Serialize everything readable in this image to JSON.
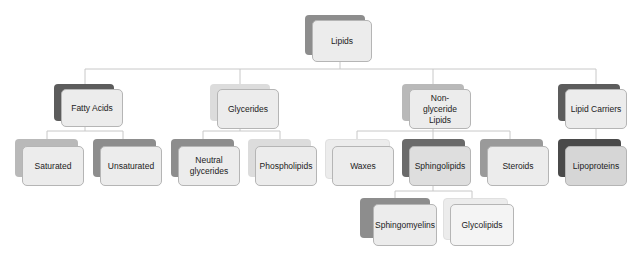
{
  "diagram": {
    "type": "hierarchy",
    "root": {
      "id": "lipids",
      "label": "Lipids",
      "shade": "#8d8d8d"
    },
    "level1": [
      {
        "id": "fatty-acids",
        "label": "Fatty Acids",
        "shade": "#5c5c5c"
      },
      {
        "id": "glycerides",
        "label": "Glycerides",
        "shade": "#dcdcdc"
      },
      {
        "id": "non-glyceride-lipids",
        "label": "Non-glyceride Lipids",
        "shade": "#a0a0a0"
      },
      {
        "id": "lipid-carriers",
        "label": "Lipid Carriers",
        "shade": "#5c5c5c"
      }
    ],
    "level2": [
      {
        "id": "saturated",
        "label": "Saturated",
        "parent": "fatty-acids",
        "shade": "#a6a6a6"
      },
      {
        "id": "unsaturated",
        "label": "Unsaturated",
        "parent": "fatty-acids",
        "shade": "#777777"
      },
      {
        "id": "neutral-glycerides",
        "label": "Neutral glycerides",
        "parent": "glycerides",
        "shade": "#8d8d8d"
      },
      {
        "id": "phospholipids",
        "label": "Phospholipids",
        "parent": "glycerides",
        "shade": "#dcdcdc"
      },
      {
        "id": "waxes",
        "label": "Waxes",
        "parent": "non-glyceride-lipids",
        "shade": "#e6e6e6"
      },
      {
        "id": "sphingolipids",
        "label": "Sphingolipids",
        "parent": "non-glyceride-lipids",
        "shade": "#6a6a6a"
      },
      {
        "id": "steroids",
        "label": "Steroids",
        "parent": "non-glyceride-lipids",
        "shade": "#9a9a9a"
      },
      {
        "id": "lipoproteins",
        "label": "Lipoproteins",
        "parent": "lipid-carriers",
        "shade": "#4a4a4a"
      }
    ],
    "level3": [
      {
        "id": "sphingomyelins",
        "label": "Sphingomyelins",
        "parent": "sphingolipids",
        "shade": "#8d8d8d"
      },
      {
        "id": "glycolipids",
        "label": "Glycolipids",
        "parent": "sphingolipids",
        "shade": "#f0f0f0"
      }
    ],
    "connector_color": "#c8c8c8"
  }
}
